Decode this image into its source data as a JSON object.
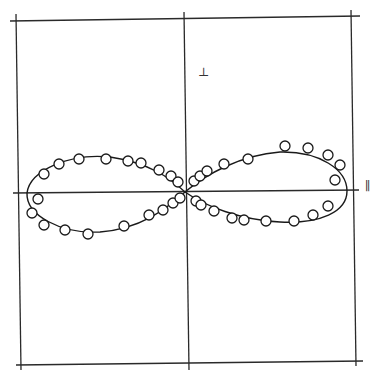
{
  "chart_data": {
    "type": "scatter",
    "title": "",
    "axes": {
      "horizontal_label": "∥",
      "vertical_label": "⊥",
      "grid": false,
      "ticks": []
    },
    "center": [
      185,
      192
    ],
    "fit_curve": {
      "shape": "lemniscate / two-lobed dipole pattern",
      "left_lobe_extent_x": 27,
      "right_lobe_extent_x": 347,
      "lobe_top_y": 155,
      "lobe_bottom_y": 230
    },
    "series": [
      {
        "name": "measured",
        "marker": "open-circle",
        "points": [
          [
            44,
            174
          ],
          [
            59,
            164
          ],
          [
            79,
            159
          ],
          [
            106,
            159
          ],
          [
            128,
            161
          ],
          [
            141,
            163
          ],
          [
            159,
            170
          ],
          [
            171,
            176
          ],
          [
            178,
            182
          ],
          [
            38,
            199
          ],
          [
            32,
            213
          ],
          [
            44,
            225
          ],
          [
            65,
            230
          ],
          [
            88,
            234
          ],
          [
            124,
            226
          ],
          [
            149,
            215
          ],
          [
            163,
            210
          ],
          [
            173,
            203
          ],
          [
            180,
            198
          ],
          [
            194,
            181
          ],
          [
            200,
            176
          ],
          [
            207,
            171
          ],
          [
            224,
            164
          ],
          [
            248,
            159
          ],
          [
            285,
            146
          ],
          [
            308,
            148
          ],
          [
            328,
            155
          ],
          [
            340,
            165
          ],
          [
            335,
            180
          ],
          [
            196,
            201
          ],
          [
            201,
            205
          ],
          [
            214,
            211
          ],
          [
            232,
            218
          ],
          [
            244,
            220
          ],
          [
            266,
            221
          ],
          [
            294,
            221
          ],
          [
            313,
            215
          ],
          [
            328,
            206
          ]
        ]
      }
    ],
    "colors": {
      "line": "#1a1a1a",
      "marker_fill": "#ffffff",
      "background": "#ffffff"
    }
  },
  "labels": {
    "perpendicular": "⊥",
    "parallel": "∥"
  }
}
